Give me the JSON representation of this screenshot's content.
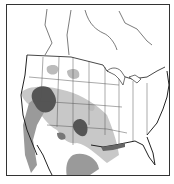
{
  "map": {
    "region": "North America (United States, southern Canada, northern Mexico)",
    "legend": [],
    "colors": {
      "background": "#ffffff",
      "border": "#333333",
      "light_shade": "#c8c8c8",
      "medium_shade": "#9a9a9a",
      "dark_shade": "#555555"
    }
  }
}
